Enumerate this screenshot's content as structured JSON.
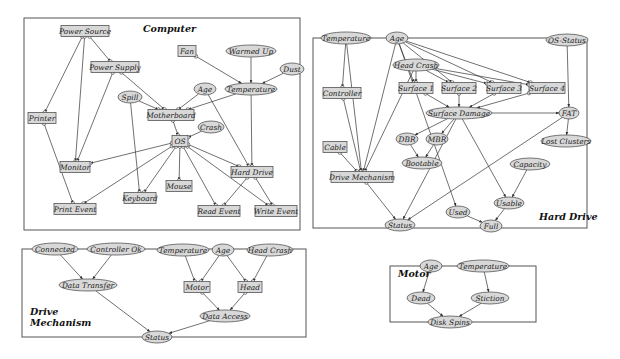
{
  "panels": [
    {
      "id": "computer",
      "title": [
        "Computer"
      ],
      "box": [
        24,
        14,
        284,
        95,
        300,
        110
      ],
      "title_pos": [
        [
          143,
          33
        ]
      ],
      "rect": [
        24,
        14,
        276,
        96
      ]
    }
  ],
  "diagram": {
    "colors": {
      "node_fill": "#d8d8d8",
      "stroke": "#555555",
      "edge": "#333333",
      "background": "#ffffff"
    },
    "panels": [
      {
        "id": "computer",
        "title_lines": [
          "Computer"
        ],
        "x": 24,
        "y": 18,
        "w": 276,
        "h": 93,
        "title_x": 143,
        "title_y": 32
      },
      {
        "id": "hard-drive",
        "title_lines": [
          "Hard Drive"
        ],
        "x": 313,
        "y": 38,
        "w": 274,
        "h": 68,
        "title_x": 539,
        "title_y": 220
      },
      {
        "id": "drive-mechanism",
        "title_lines": [
          "Drive",
          "Mechanism"
        ],
        "x": 22,
        "y": 247,
        "w": 284,
        "h": 88,
        "title_x": 30,
        "title_y": 315
      },
      {
        "id": "motor",
        "title_lines": [
          "Motor"
        ],
        "x": 390,
        "y": 265,
        "w": 146,
        "h": 58,
        "title_x": 398,
        "title_y": 277
      }
    ],
    "nodes": [
      {
        "id": "c-power-source",
        "label": "Power Source",
        "shape": "rect",
        "x": 85,
        "y": 31,
        "w": 48,
        "h": 11
      },
      {
        "id": "c-power-supply",
        "label": "Power Supply",
        "shape": "rect",
        "x": 115,
        "y": 67,
        "w": 48,
        "h": 11
      },
      {
        "id": "c-fan",
        "label": "Fan",
        "shape": "rect",
        "x": 187,
        "y": 51,
        "w": 18,
        "h": 11
      },
      {
        "id": "c-warmed-up",
        "label": "Warmed Up",
        "shape": "ellipse",
        "x": 251,
        "y": 51,
        "w": 50,
        "h": 12
      },
      {
        "id": "c-dust",
        "label": "Dust",
        "shape": "ellipse",
        "x": 292,
        "y": 69,
        "w": 24,
        "h": 12
      },
      {
        "id": "c-age",
        "label": "Age",
        "shape": "ellipse",
        "x": 205,
        "y": 89,
        "w": 22,
        "h": 12
      },
      {
        "id": "c-temperature",
        "label": "Temperature",
        "shape": "ellipse",
        "x": 251,
        "y": 89,
        "w": 52,
        "h": 12
      },
      {
        "id": "c-spill",
        "label": "Spill",
        "shape": "ellipse",
        "x": 130,
        "y": 97,
        "w": 24,
        "h": 12
      },
      {
        "id": "c-motherboard",
        "label": "Motherboard",
        "shape": "rect",
        "x": 171,
        "y": 115,
        "w": 46,
        "h": 11
      },
      {
        "id": "c-printer",
        "label": "Printer",
        "shape": "rect",
        "x": 42,
        "y": 118,
        "w": 28,
        "h": 11
      },
      {
        "id": "c-crash",
        "label": "Crash",
        "shape": "ellipse",
        "x": 211,
        "y": 127,
        "w": 26,
        "h": 12
      },
      {
        "id": "c-os",
        "label": "OS",
        "shape": "rect",
        "x": 180,
        "y": 141,
        "w": 16,
        "h": 11
      },
      {
        "id": "c-monitor",
        "label": "Monitor",
        "shape": "rect",
        "x": 75,
        "y": 167,
        "w": 30,
        "h": 11
      },
      {
        "id": "c-hard-drive",
        "label": "Hard Drive",
        "shape": "rect",
        "x": 252,
        "y": 172,
        "w": 42,
        "h": 11
      },
      {
        "id": "c-mouse",
        "label": "Mouse",
        "shape": "rect",
        "x": 179,
        "y": 186,
        "w": 26,
        "h": 11
      },
      {
        "id": "c-keyboard",
        "label": "Keyboard",
        "shape": "rect",
        "x": 140,
        "y": 198,
        "w": 32,
        "h": 11
      },
      {
        "id": "c-print-event",
        "label": "Print Event",
        "shape": "rect",
        "x": 75,
        "y": 209,
        "w": 42,
        "h": 11
      },
      {
        "id": "c-read-event",
        "label": "Read Event",
        "shape": "rect",
        "x": 219,
        "y": 211,
        "w": 42,
        "h": 11
      },
      {
        "id": "c-write-event",
        "label": "Write Event",
        "shape": "rect",
        "x": 276,
        "y": 211,
        "w": 42,
        "h": 11
      },
      {
        "id": "h-temperature",
        "label": "Temperature",
        "shape": "ellipse",
        "x": 346,
        "y": 38,
        "w": 50,
        "h": 12
      },
      {
        "id": "h-age",
        "label": "Age",
        "shape": "ellipse",
        "x": 397,
        "y": 38,
        "w": 22,
        "h": 12
      },
      {
        "id": "h-os-status",
        "label": "OS-Status",
        "shape": "ellipse",
        "x": 567,
        "y": 40,
        "w": 42,
        "h": 12
      },
      {
        "id": "h-head-crash",
        "label": "Head Crash",
        "shape": "ellipse",
        "x": 416,
        "y": 65,
        "w": 46,
        "h": 12
      },
      {
        "id": "h-controller",
        "label": "Controller",
        "shape": "rect",
        "x": 342,
        "y": 93,
        "w": 38,
        "h": 11
      },
      {
        "id": "h-surface-1",
        "label": "Surface 1",
        "shape": "rect",
        "x": 416,
        "y": 88,
        "w": 34,
        "h": 11
      },
      {
        "id": "h-surface-2",
        "label": "Surface 2",
        "shape": "rect",
        "x": 459,
        "y": 88,
        "w": 34,
        "h": 11
      },
      {
        "id": "h-surface-3",
        "label": "Surface 3",
        "shape": "rect",
        "x": 504,
        "y": 88,
        "w": 34,
        "h": 11
      },
      {
        "id": "h-surface-4",
        "label": "Surface 4",
        "shape": "rect",
        "x": 547,
        "y": 88,
        "w": 36,
        "h": 11
      },
      {
        "id": "h-surface-damage",
        "label": "Surface Damage",
        "shape": "ellipse",
        "x": 459,
        "y": 113,
        "w": 66,
        "h": 12
      },
      {
        "id": "h-fat",
        "label": "FAT",
        "shape": "ellipse",
        "x": 569,
        "y": 113,
        "w": 20,
        "h": 12
      },
      {
        "id": "h-dbr",
        "label": "DBR",
        "shape": "ellipse",
        "x": 407,
        "y": 139,
        "w": 22,
        "h": 12
      },
      {
        "id": "h-mbr",
        "label": "MBR",
        "shape": "ellipse",
        "x": 437,
        "y": 139,
        "w": 22,
        "h": 12
      },
      {
        "id": "h-lost-clusters",
        "label": "Lost Clusters",
        "shape": "ellipse",
        "x": 566,
        "y": 141,
        "w": 50,
        "h": 12
      },
      {
        "id": "h-cable",
        "label": "Cable",
        "shape": "rect",
        "x": 335,
        "y": 147,
        "w": 24,
        "h": 11
      },
      {
        "id": "h-bootable",
        "label": "Bootable",
        "shape": "ellipse",
        "x": 422,
        "y": 163,
        "w": 40,
        "h": 12
      },
      {
        "id": "h-capacity",
        "label": "Capacity",
        "shape": "ellipse",
        "x": 530,
        "y": 164,
        "w": 40,
        "h": 12
      },
      {
        "id": "h-drive-mechanism",
        "label": "Drive Mechanism",
        "shape": "rect",
        "x": 362,
        "y": 177,
        "w": 62,
        "h": 11
      },
      {
        "id": "h-usable",
        "label": "Usable",
        "shape": "ellipse",
        "x": 509,
        "y": 203,
        "w": 30,
        "h": 12
      },
      {
        "id": "h-used",
        "label": "Used",
        "shape": "ellipse",
        "x": 458,
        "y": 212,
        "w": 24,
        "h": 12
      },
      {
        "id": "h-status",
        "label": "Status",
        "shape": "ellipse",
        "x": 400,
        "y": 225,
        "w": 30,
        "h": 12
      },
      {
        "id": "h-full",
        "label": "Full",
        "shape": "ellipse",
        "x": 491,
        "y": 226,
        "w": 22,
        "h": 12
      },
      {
        "id": "d-connected",
        "label": "Connected",
        "shape": "ellipse",
        "x": 55,
        "y": 249,
        "w": 46,
        "h": 12
      },
      {
        "id": "d-controller-ok",
        "label": "Controller Ok",
        "shape": "ellipse",
        "x": 116,
        "y": 249,
        "w": 58,
        "h": 12
      },
      {
        "id": "d-temperature",
        "label": "Temperature",
        "shape": "ellipse",
        "x": 183,
        "y": 250,
        "w": 52,
        "h": 12
      },
      {
        "id": "d-age",
        "label": "Age",
        "shape": "ellipse",
        "x": 223,
        "y": 250,
        "w": 22,
        "h": 12
      },
      {
        "id": "d-head-crash",
        "label": "Head Crash",
        "shape": "ellipse",
        "x": 270,
        "y": 250,
        "w": 46,
        "h": 12
      },
      {
        "id": "d-data-transfer",
        "label": "Data Transfer",
        "shape": "ellipse",
        "x": 88,
        "y": 285,
        "w": 58,
        "h": 12
      },
      {
        "id": "d-motor",
        "label": "Motor",
        "shape": "rect",
        "x": 197,
        "y": 287,
        "w": 26,
        "h": 11
      },
      {
        "id": "d-head",
        "label": "Head",
        "shape": "rect",
        "x": 250,
        "y": 287,
        "w": 24,
        "h": 11
      },
      {
        "id": "d-data-access",
        "label": "Data Access",
        "shape": "ellipse",
        "x": 225,
        "y": 316,
        "w": 50,
        "h": 12
      },
      {
        "id": "d-status",
        "label": "Status",
        "shape": "ellipse",
        "x": 157,
        "y": 337,
        "w": 30,
        "h": 12
      },
      {
        "id": "m-age",
        "label": "Age",
        "shape": "ellipse",
        "x": 431,
        "y": 266,
        "w": 22,
        "h": 12
      },
      {
        "id": "m-temperature",
        "label": "Temperature",
        "shape": "ellipse",
        "x": 483,
        "y": 266,
        "w": 52,
        "h": 12
      },
      {
        "id": "m-dead",
        "label": "Dead",
        "shape": "ellipse",
        "x": 421,
        "y": 298,
        "w": 28,
        "h": 12
      },
      {
        "id": "m-stiction",
        "label": "Stiction",
        "shape": "ellipse",
        "x": 490,
        "y": 298,
        "w": 38,
        "h": 12
      },
      {
        "id": "m-disk-spins",
        "label": "Disk Spins",
        "shape": "ellipse",
        "x": 450,
        "y": 322,
        "w": 44,
        "h": 12
      }
    ],
    "edges": [
      [
        "c-power-source",
        "c-power-supply"
      ],
      [
        "c-power-source",
        "c-printer"
      ],
      [
        "c-power-source",
        "c-monitor"
      ],
      [
        "c-power-supply",
        "c-motherboard"
      ],
      [
        "c-power-supply",
        "c-monitor"
      ],
      [
        "c-fan",
        "c-temperature"
      ],
      [
        "c-warmed-up",
        "c-temperature"
      ],
      [
        "c-dust",
        "c-temperature"
      ],
      [
        "c-temperature",
        "c-motherboard"
      ],
      [
        "c-temperature",
        "c-hard-drive"
      ],
      [
        "c-age",
        "c-motherboard"
      ],
      [
        "c-age",
        "c-hard-drive"
      ],
      [
        "c-spill",
        "c-motherboard"
      ],
      [
        "c-spill",
        "c-keyboard"
      ],
      [
        "c-motherboard",
        "c-os"
      ],
      [
        "c-crash",
        "c-os"
      ],
      [
        "c-os",
        "c-monitor"
      ],
      [
        "c-os",
        "c-print-event"
      ],
      [
        "c-os",
        "c-keyboard"
      ],
      [
        "c-os",
        "c-mouse"
      ],
      [
        "c-os",
        "c-read-event"
      ],
      [
        "c-os",
        "c-write-event"
      ],
      [
        "c-os",
        "c-hard-drive"
      ],
      [
        "c-printer",
        "c-print-event"
      ],
      [
        "c-hard-drive",
        "c-read-event"
      ],
      [
        "c-hard-drive",
        "c-write-event"
      ],
      [
        "h-temperature",
        "h-controller"
      ],
      [
        "h-temperature",
        "h-drive-mechanism"
      ],
      [
        "h-age",
        "h-surface-1"
      ],
      [
        "h-age",
        "h-surface-2"
      ],
      [
        "h-age",
        "h-surface-3"
      ],
      [
        "h-age",
        "h-surface-4"
      ],
      [
        "h-age",
        "h-drive-mechanism"
      ],
      [
        "h-age",
        "h-used"
      ],
      [
        "h-head-crash",
        "h-surface-1"
      ],
      [
        "h-head-crash",
        "h-surface-2"
      ],
      [
        "h-head-crash",
        "h-surface-3"
      ],
      [
        "h-head-crash",
        "h-surface-4"
      ],
      [
        "h-head-crash",
        "h-drive-mechanism"
      ],
      [
        "h-surface-1",
        "h-surface-damage"
      ],
      [
        "h-surface-2",
        "h-surface-damage"
      ],
      [
        "h-surface-3",
        "h-surface-damage"
      ],
      [
        "h-surface-4",
        "h-surface-damage"
      ],
      [
        "h-surface-damage",
        "h-fat"
      ],
      [
        "h-surface-damage",
        "h-dbr"
      ],
      [
        "h-surface-damage",
        "h-mbr"
      ],
      [
        "h-surface-damage",
        "h-status"
      ],
      [
        "h-surface-damage",
        "h-usable"
      ],
      [
        "h-os-status",
        "h-fat"
      ],
      [
        "h-fat",
        "h-lost-clusters"
      ],
      [
        "h-fat",
        "h-status"
      ],
      [
        "h-dbr",
        "h-bootable"
      ],
      [
        "h-mbr",
        "h-bootable"
      ],
      [
        "h-controller",
        "h-drive-mechanism"
      ],
      [
        "h-cable",
        "h-drive-mechanism"
      ],
      [
        "h-drive-mechanism",
        "h-status"
      ],
      [
        "h-capacity",
        "h-usable"
      ],
      [
        "h-usable",
        "h-full"
      ],
      [
        "h-used",
        "h-full"
      ],
      [
        "d-connected",
        "d-data-transfer"
      ],
      [
        "d-controller-ok",
        "d-data-transfer"
      ],
      [
        "d-temperature",
        "d-motor"
      ],
      [
        "d-age",
        "d-motor"
      ],
      [
        "d-age",
        "d-head"
      ],
      [
        "d-head-crash",
        "d-head"
      ],
      [
        "d-motor",
        "d-data-access"
      ],
      [
        "d-head",
        "d-data-access"
      ],
      [
        "d-data-transfer",
        "d-status"
      ],
      [
        "d-data-access",
        "d-status"
      ],
      [
        "m-age",
        "m-dead"
      ],
      [
        "m-temperature",
        "m-stiction"
      ],
      [
        "m-dead",
        "m-disk-spins"
      ],
      [
        "m-stiction",
        "m-disk-spins"
      ]
    ]
  }
}
